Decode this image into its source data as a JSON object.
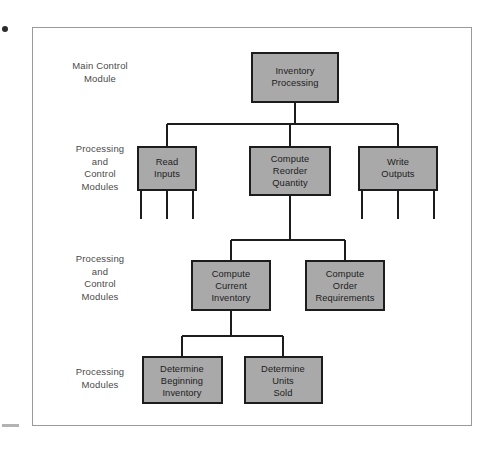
{
  "diagram": {
    "type": "structure-chart",
    "colors": {
      "node_fill": "#a9a9a9",
      "node_stroke": "#1c1c1c",
      "connector": "#1c1c1c",
      "frame_border": "#9a9a9a",
      "label_text": "#4a4a4a",
      "node_text": "#1c1c1c",
      "page_background": "#ffffff"
    },
    "row_labels": [
      {
        "id": "row-1",
        "text": "Main Control\nModule"
      },
      {
        "id": "row-2",
        "text": "Processing\nand\nControl\nModules"
      },
      {
        "id": "row-3",
        "text": "Processing\nand\nControl\nModules"
      },
      {
        "id": "row-4",
        "text": "Processing\nModules"
      }
    ],
    "nodes": [
      {
        "id": "inventory-processing",
        "level": 1,
        "lines": [
          "Inventory",
          "Processing"
        ]
      },
      {
        "id": "read-inputs",
        "level": 2,
        "lines": [
          "Read",
          "Inputs"
        ]
      },
      {
        "id": "compute-reorder-quantity",
        "level": 2,
        "lines": [
          "Compute",
          "Reorder",
          "Quantity"
        ]
      },
      {
        "id": "write-outputs",
        "level": 2,
        "lines": [
          "Write",
          "Outputs"
        ]
      },
      {
        "id": "compute-current-inventory",
        "level": 3,
        "lines": [
          "Compute",
          "Current",
          "Inventory"
        ]
      },
      {
        "id": "compute-order-requirements",
        "level": 3,
        "lines": [
          "Compute",
          "Order",
          "Requirements"
        ]
      },
      {
        "id": "determine-beginning-inventory",
        "level": 4,
        "lines": [
          "Determine",
          "Beginning",
          "Inventory"
        ]
      },
      {
        "id": "determine-units-sold",
        "level": 4,
        "lines": [
          "Determine",
          "Units",
          "Sold"
        ]
      }
    ],
    "edges": [
      {
        "from": "inventory-processing",
        "to": "read-inputs"
      },
      {
        "from": "inventory-processing",
        "to": "compute-reorder-quantity"
      },
      {
        "from": "inventory-processing",
        "to": "write-outputs"
      },
      {
        "from": "compute-reorder-quantity",
        "to": "compute-current-inventory"
      },
      {
        "from": "compute-reorder-quantity",
        "to": "compute-order-requirements"
      },
      {
        "from": "compute-current-inventory",
        "to": "determine-beginning-inventory"
      },
      {
        "from": "compute-current-inventory",
        "to": "determine-units-sold"
      }
    ],
    "stubs": [
      {
        "parent": "read-inputs",
        "count": 3
      },
      {
        "parent": "write-outputs",
        "count": 3
      }
    ]
  }
}
